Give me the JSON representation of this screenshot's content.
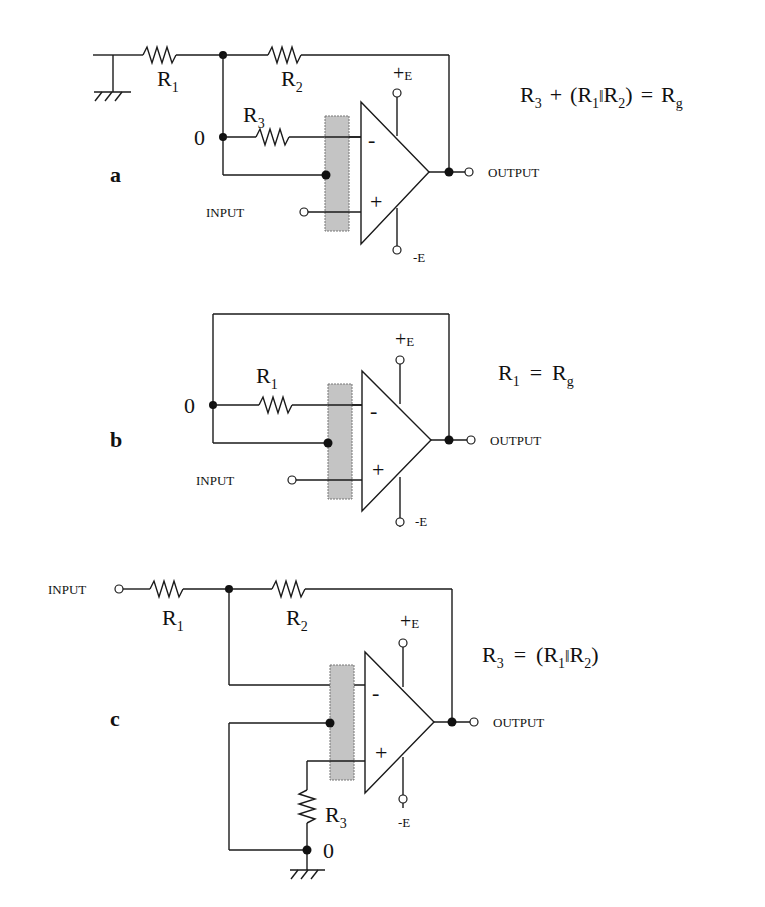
{
  "figure": {
    "panels": [
      {
        "id": "a",
        "label": "a",
        "equation": {
          "r3": "R",
          "r3_sub": "3",
          "plus": "+",
          "open": "(R",
          "r1_sub": "1",
          "par": "ǁ",
          "r2": "R",
          "r2_sub": "2",
          "close": ")",
          "eq": "=",
          "rg": "R",
          "rg_sub": "g"
        },
        "resistors": {
          "r1": "R",
          "r1_sub": "1",
          "r2": "R",
          "r2_sub": "2",
          "r3": "R",
          "r3_sub": "3"
        },
        "node_zero": "0",
        "input_label": "INPUT",
        "output_label": "OUTPUT",
        "supply_pos": "+E",
        "supply_neg": "-E",
        "minus_sign": "-",
        "plus_sign": "+"
      },
      {
        "id": "b",
        "label": "b",
        "equation": {
          "r1": "R",
          "r1_sub": "1",
          "eq": "=",
          "rg": "R",
          "rg_sub": "g"
        },
        "resistors": {
          "r1": "R",
          "r1_sub": "1"
        },
        "node_zero": "0",
        "input_label": "INPUT",
        "output_label": "OUTPUT",
        "supply_pos": "+E",
        "supply_neg": "-E",
        "minus_sign": "-",
        "plus_sign": "+"
      },
      {
        "id": "c",
        "label": "c",
        "equation": {
          "r3": "R",
          "r3_sub": "3",
          "eq": "=",
          "open": "(R",
          "r1_sub": "1",
          "par": "ǁ",
          "r2": "R",
          "r2_sub": "2",
          "close": ")"
        },
        "resistors": {
          "r1": "R",
          "r1_sub": "1",
          "r2": "R",
          "r2_sub": "2",
          "r3": "R",
          "r3_sub": "3"
        },
        "node_zero": "0",
        "input_label": "INPUT",
        "output_label": "OUTPUT",
        "supply_pos": "+E",
        "supply_neg": "-E",
        "minus_sign": "-",
        "plus_sign": "+"
      }
    ]
  }
}
